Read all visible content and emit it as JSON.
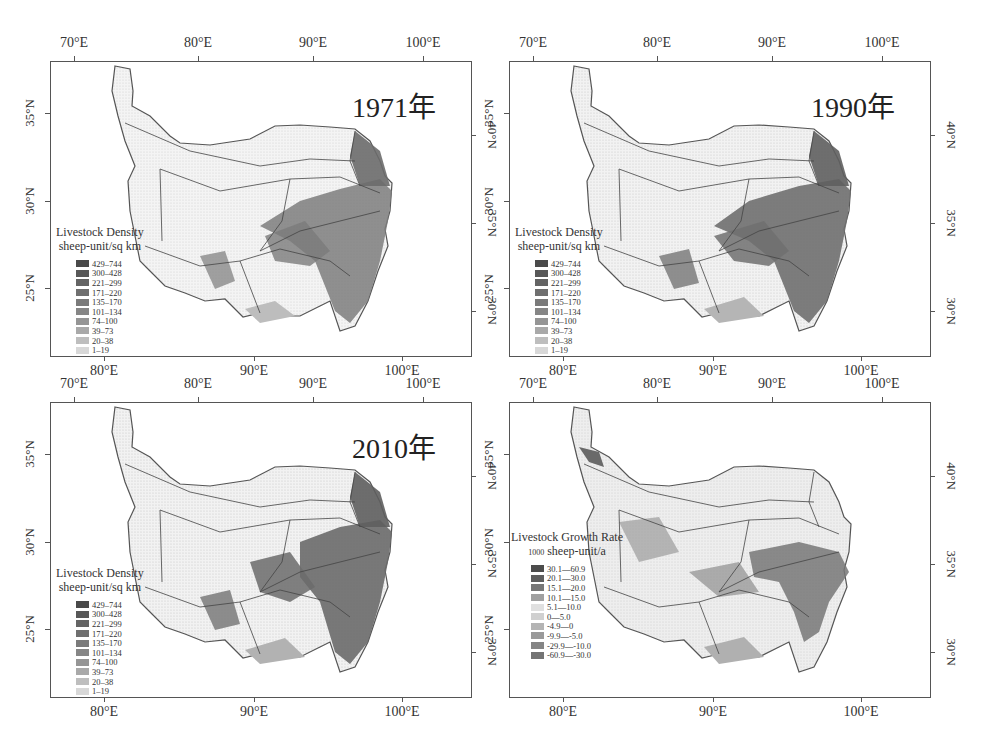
{
  "figure": {
    "panels": [
      {
        "id": "p1971",
        "year_label": "1971年",
        "legend_title": "Livestock Density",
        "legend_unit": "sheep-unit/sq km",
        "legend_unit_prefix": "",
        "classes": [
          "429–744",
          "300–428",
          "221–299",
          "171–220",
          "135–170",
          "101–134",
          "74–100",
          "39–73",
          "20–38",
          "1–19"
        ],
        "class_colors": [
          "#4a4a4a",
          "#585858",
          "#646464",
          "#6f6f6f",
          "#7a7a7a",
          "#868686",
          "#959595",
          "#a9a9a9",
          "#bebebe",
          "#d8d8d8"
        ]
      },
      {
        "id": "p1990",
        "year_label": "1990年",
        "legend_title": "Livestock Density",
        "legend_unit": "sheep-unit/sq km",
        "legend_unit_prefix": "",
        "classes": [
          "429–744",
          "300–428",
          "221–299",
          "171–220",
          "135–170",
          "101–134",
          "74–100",
          "39–73",
          "20–38",
          "1–19"
        ],
        "class_colors": [
          "#4a4a4a",
          "#585858",
          "#646464",
          "#6f6f6f",
          "#7a7a7a",
          "#868686",
          "#959595",
          "#a9a9a9",
          "#bebebe",
          "#d8d8d8"
        ]
      },
      {
        "id": "p2010",
        "year_label": "2010年",
        "legend_title": "Livestock Density",
        "legend_unit": "sheep-unit/sq km",
        "legend_unit_prefix": "",
        "classes": [
          "429–744",
          "300–428",
          "221–299",
          "171–220",
          "135–170",
          "101–134",
          "74–100",
          "39–73",
          "20–38",
          "1–19"
        ],
        "class_colors": [
          "#4a4a4a",
          "#585858",
          "#646464",
          "#6f6f6f",
          "#7a7a7a",
          "#868686",
          "#959595",
          "#a9a9a9",
          "#bebebe",
          "#d8d8d8"
        ]
      },
      {
        "id": "pgrowth",
        "year_label": "",
        "legend_title": "Livestock Growth Rate",
        "legend_unit": "sheep-unit/a",
        "legend_unit_prefix": "1000",
        "classes": [
          "30.1—60.9",
          "20.1—30.0",
          "15.1—20.0",
          "10.1—15.0",
          "5.1—10.0",
          "0—5.0",
          "-4.9—0",
          "-9.9—-5.0",
          "-29.9—-10.0",
          "-60.9—-30.0"
        ],
        "class_colors": [
          "#4c4c4c",
          "#5e5e5e",
          "#777777",
          "#a0a0a0",
          "#e0e0e0",
          "#d0d0d0",
          "#b4b4b4",
          "#9a9a9a",
          "#858585",
          "#747474"
        ]
      }
    ],
    "axes": {
      "top_lon_ticks": [
        "70°E",
        "80°E",
        "90°E",
        "100°E"
      ],
      "bottom_lon_ticks": [
        "80°E",
        "90°E",
        "100°E"
      ],
      "left_lat_ticks": [
        "35°N",
        "30°N",
        "25°N"
      ],
      "right_lat_ticks": [
        "40°N",
        "35°N",
        "30°N"
      ]
    }
  }
}
